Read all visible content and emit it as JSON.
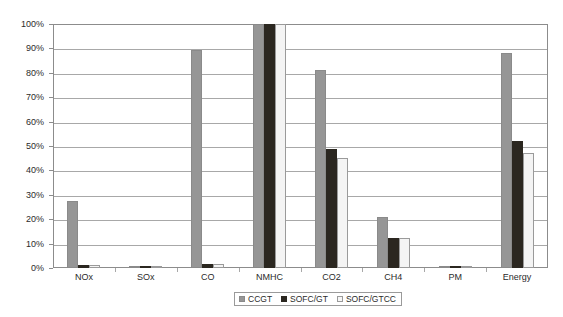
{
  "chart_data": {
    "type": "bar",
    "title": "",
    "xlabel": "",
    "ylabel": "Relative to conventional system",
    "ylim": [
      0,
      100
    ],
    "y_unit": "%",
    "grid": true,
    "legend_position": "bottom-center",
    "categories": [
      "NOx",
      "SOx",
      "CO",
      "NMHC",
      "CO2",
      "CH4",
      "PM",
      "Energy"
    ],
    "ytick_labels": [
      "0%",
      "10%",
      "20%",
      "30%",
      "40%",
      "50%",
      "60%",
      "70%",
      "80%",
      "90%",
      "100%"
    ],
    "ytick_values": [
      0,
      10,
      20,
      30,
      40,
      50,
      60,
      70,
      80,
      90,
      100
    ],
    "series": [
      {
        "name": "CCGT",
        "color": "#969696",
        "values": [
          27.3,
          0.4,
          89.5,
          100,
          81,
          21,
          0.4,
          88
        ]
      },
      {
        "name": "SOFC/GT",
        "color": "#2b2720",
        "values": [
          1.1,
          0.3,
          1.5,
          100,
          48.8,
          12.5,
          0.3,
          52
        ]
      },
      {
        "name": "SOFC/GTCC",
        "color": "#f4f4f4",
        "values": [
          1.2,
          0.3,
          1.6,
          100,
          45,
          12.5,
          0.3,
          47
        ]
      }
    ]
  }
}
